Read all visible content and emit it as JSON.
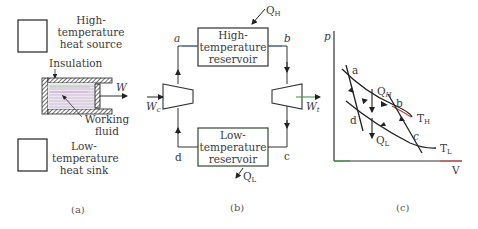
{
  "panel_a": {
    "source_label_1": "High-",
    "source_label_2": "temperature",
    "source_label_3": "heat source",
    "insulation_label": "Insulation",
    "work_label": "W",
    "fluid_label_1": "Working",
    "fluid_label_2": "fluid",
    "sink_label_1": "Low-",
    "sink_label_2": "temperature",
    "sink_label_3": "heat sink",
    "caption": "(a)"
  },
  "panel_b": {
    "hot_res_1": "High-",
    "hot_res_2": "temperature",
    "hot_res_3": "reservoir",
    "cold_res_1": "Low-",
    "cold_res_2": "temperature",
    "cold_res_3": "reservoir",
    "qh": "Q",
    "qh_sub": "H",
    "ql": "Q",
    "ql_sub": "L",
    "wc": "W",
    "wc_sub": "c",
    "wt": "W",
    "wt_sub": "t",
    "node_a": "a",
    "node_b": "b",
    "node_c": "c",
    "node_d": "d",
    "caption": "(b)"
  },
  "panel_c": {
    "y_axis": "p",
    "x_axis": "V",
    "pt_a": "a",
    "pt_b": "b",
    "pt_c": "c",
    "pt_d": "d",
    "qh": "Q",
    "qh_sub": "H",
    "ql": "Q",
    "ql_sub": "L",
    "th": "T",
    "th_sub": "H",
    "tl": "T",
    "tl_sub": "L",
    "caption": "(c)"
  },
  "colors": {
    "line": "#2a2a2a",
    "text": "#3a3a3a",
    "pipe_accent": "#4a6fd0",
    "arrow_out": "#2c8a3c",
    "curve_accent": "#c04040"
  }
}
